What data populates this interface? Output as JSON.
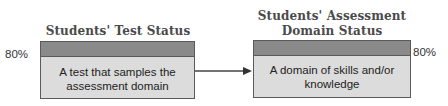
{
  "left": {
    "title": "Students' Test Status",
    "percent": "80%",
    "text_line1": "A test that samples the",
    "text_line2": "assessment domain"
  },
  "right": {
    "title_line1": "Students' Assessment",
    "title_line2": "Domain Status",
    "percent": "80%",
    "text_line1": "A domain of skills and/or",
    "text_line2": "knowledge"
  },
  "colors": {
    "band": "#8a8a8a",
    "box_fill": "#dcdcdc",
    "border": "#5a5a5a",
    "title": "#4a4a4a"
  }
}
